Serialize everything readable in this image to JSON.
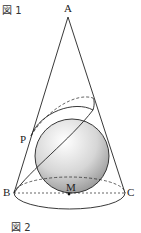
{
  "figure1": {
    "label": "図 1"
  },
  "figure2": {
    "label": "図 2"
  },
  "points": {
    "A": "A",
    "P": "P",
    "B": "B",
    "C": "C",
    "M": "M"
  },
  "colors": {
    "line": "#222222",
    "sphere_light": "#ffffff",
    "sphere_dark": "#8a8a8a"
  }
}
